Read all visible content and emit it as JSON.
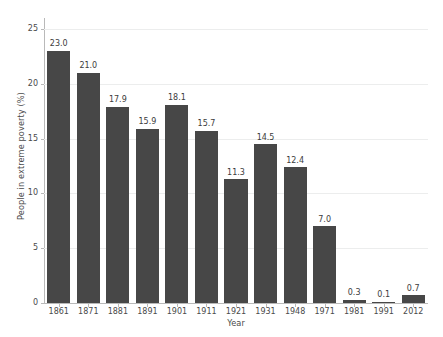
{
  "chart_data": {
    "type": "bar",
    "title": "",
    "subtitle": "",
    "xlabel": "Year",
    "ylabel": "People in extreme poverty (%)",
    "categories": [
      "1861",
      "1871",
      "1881",
      "1891",
      "1901",
      "1911",
      "1921",
      "1931",
      "1948",
      "1971",
      "1981",
      "1991",
      "2012"
    ],
    "values": [
      23.0,
      21.0,
      17.9,
      15.9,
      18.1,
      15.7,
      11.3,
      14.5,
      12.4,
      7.0,
      0.3,
      0.1,
      0.7
    ],
    "value_labels": [
      "23.0",
      "21.0",
      "17.9",
      "15.9",
      "18.1",
      "15.7",
      "11.3",
      "14.5",
      "12.4",
      "7.0",
      "0.3",
      "0.1",
      "0.7"
    ],
    "ylim": [
      0,
      26
    ],
    "xlim_note": "categorical",
    "yticks": [
      0,
      5,
      10,
      15,
      20,
      25
    ],
    "ytick_labels": [
      "0",
      "5",
      "10",
      "15",
      "20",
      "25"
    ],
    "grid": "horizontal",
    "legend": "none",
    "bar_color": "#474747",
    "gridline_color": "#eceded",
    "axis_color": "#b9b9b9",
    "text_color": "#4a4a4a",
    "background": "#ffffff"
  }
}
